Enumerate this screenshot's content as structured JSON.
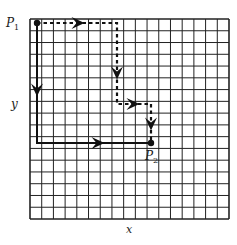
{
  "diagram": {
    "grid": {
      "x0": 30,
      "y0": 19,
      "x1": 229,
      "y1": 219,
      "cols": 17,
      "rows": 17,
      "line_color": "#222222"
    },
    "labels": {
      "p1": "P",
      "p1_sub": "1",
      "p2": "P",
      "p2_sub": "2",
      "x_axis": "x",
      "y_axis": "y"
    },
    "points": {
      "P1": [
        37,
        23
      ],
      "P2": [
        151,
        143
      ]
    },
    "paths": [
      {
        "name": "solid-path",
        "style": "solid",
        "points": [
          [
            37,
            23
          ],
          [
            37,
            143
          ],
          [
            151,
            143
          ]
        ],
        "arrows": [
          [
            37,
            90,
            "down"
          ],
          [
            98,
            143,
            "right"
          ]
        ]
      },
      {
        "name": "dashed-path",
        "style": "dashed",
        "points": [
          [
            37,
            23
          ],
          [
            117,
            23
          ],
          [
            117,
            104
          ],
          [
            151,
            104
          ],
          [
            151,
            143
          ]
        ],
        "arrows": [
          [
            78,
            23,
            "right"
          ],
          [
            117,
            73,
            "down"
          ],
          [
            133,
            104,
            "right"
          ],
          [
            151,
            124,
            "down"
          ]
        ]
      }
    ],
    "colors": {
      "ink": "#111111",
      "background": "#ffffff"
    }
  }
}
